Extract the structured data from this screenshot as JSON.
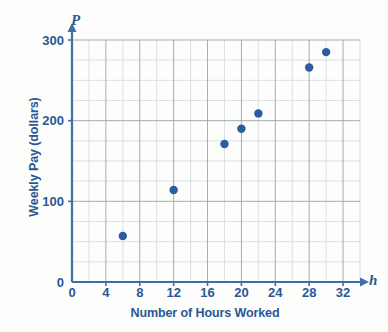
{
  "chart_data": {
    "type": "scatter",
    "title": "",
    "xlabel": "Number of Hours Worked",
    "ylabel": "Weekly Pay (dollars)",
    "x_var_symbol": "h",
    "y_var_symbol": "P",
    "xlim": [
      0,
      34
    ],
    "ylim": [
      0,
      300
    ],
    "x_ticks": [
      0,
      4,
      8,
      12,
      16,
      20,
      24,
      28,
      32
    ],
    "x_tick_labels": [
      "0",
      "4",
      "8",
      "12",
      "16",
      "20",
      "24",
      "28",
      "32"
    ],
    "x_minor_step": 2,
    "y_ticks": [
      0,
      100,
      200,
      300
    ],
    "y_tick_labels": [
      "0",
      "100",
      "200",
      "300"
    ],
    "y_minor_step": 25,
    "grid": true,
    "legend": null,
    "point_color": "#2d5b9e",
    "axis_color": "#3f6fa8",
    "grid_color": "#9aa3ac",
    "grid_minor_color": "#cfd4da",
    "text_color": "#2a5896",
    "background": "#fdfdfb",
    "points": [
      {
        "x": 6,
        "y": 57
      },
      {
        "x": 12,
        "y": 114
      },
      {
        "x": 18,
        "y": 171
      },
      {
        "x": 20,
        "y": 190
      },
      {
        "x": 22,
        "y": 209
      },
      {
        "x": 28,
        "y": 266
      },
      {
        "x": 30,
        "y": 285
      }
    ]
  }
}
